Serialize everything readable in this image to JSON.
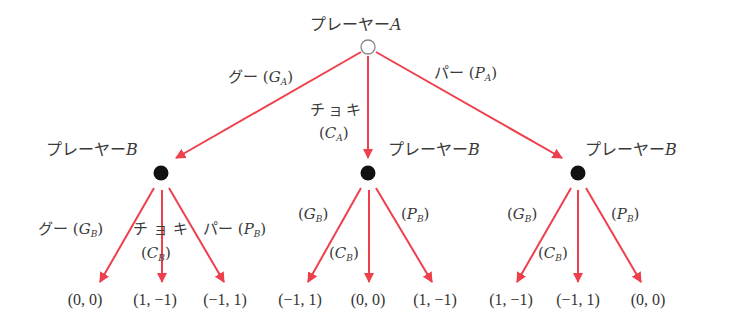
{
  "colors": {
    "arrow": "#ee3f4c",
    "node_filled": "#111111",
    "node_open_stroke": "#888888",
    "text": "#3a3a3a"
  },
  "root": {
    "player_label": "プレーヤー",
    "player_letter": "A",
    "node": "open-circle"
  },
  "player_a_moves": [
    {
      "jp": "グー",
      "symbol": "G",
      "sub": "A"
    },
    {
      "jp": "チョキ",
      "symbol": "C",
      "sub": "A"
    },
    {
      "jp": "パー",
      "symbol": "P",
      "sub": "A"
    }
  ],
  "player_b_nodes": [
    {
      "player_label": "プレーヤー",
      "player_letter": "B"
    },
    {
      "player_label": "プレーヤー",
      "player_letter": "B"
    },
    {
      "player_label": "プレーヤー",
      "player_letter": "B"
    }
  ],
  "player_b_moves_first": [
    {
      "jp": "グー",
      "symbol": "G",
      "sub": "B"
    },
    {
      "jp": "チョキ",
      "symbol": "C",
      "sub": "B"
    },
    {
      "jp": "パー",
      "symbol": "P",
      "sub": "B"
    }
  ],
  "player_b_moves_other": [
    {
      "symbol": "G",
      "sub": "B"
    },
    {
      "symbol": "C",
      "sub": "B"
    },
    {
      "symbol": "P",
      "sub": "B"
    }
  ],
  "payoffs": [
    "(0, 0)",
    "(1, −1)",
    "(−1, 1)",
    "(−1, 1)",
    "(0, 0)",
    "(1, −1)",
    "(1, −1)",
    "(−1, 1)",
    "(0, 0)"
  ],
  "punct": {
    "open": "(",
    "close": ")",
    "dash": "−"
  }
}
